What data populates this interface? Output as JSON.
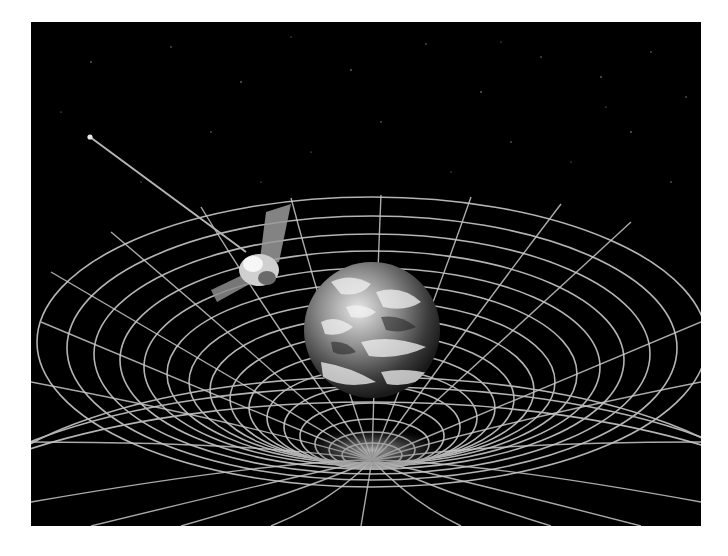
{
  "image": {
    "subject": "Satellite orbiting Earth above a curved spacetime grid",
    "background_color": "#ffffff",
    "space_color": "#000000",
    "grid_color": "#c8c8c8",
    "elements": {
      "satellite": "satellite-with-antenna",
      "planet": "earth",
      "grid": "spacetime-curvature-grid",
      "stars": "starfield"
    }
  }
}
